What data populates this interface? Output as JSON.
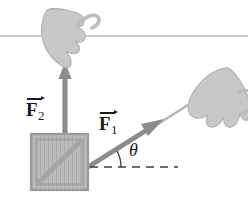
{
  "figure": {
    "background_color": "#ffffff",
    "width": 248,
    "height": 212
  },
  "labels": {
    "force_1": {
      "symbol": "F",
      "subscript": "1",
      "name": "F1"
    },
    "force_2": {
      "symbol": "F",
      "subscript": "2",
      "name": "F2"
    },
    "angle": {
      "symbol": "θ",
      "name": "theta"
    }
  },
  "colors": {
    "arrow": "#8c8c8c",
    "hand": "#c9c9c9",
    "hand_outline": "#b0b0b0",
    "crate_fill": "#bdbdbd",
    "crate_border": "#9a9a9a",
    "crate_plank": "#a8a8a8",
    "ceiling_line": "#b8b8b8",
    "dashed_line": "#3a3a3a",
    "text": "#1a1a1a"
  },
  "elements": {
    "ceiling_line": {
      "name": "ceiling-line",
      "y": 36,
      "x_start": 0,
      "x_end": 248
    },
    "crate": {
      "name": "crate",
      "x": 31,
      "y": 134,
      "width": 57,
      "height": 56
    },
    "force_2_arrow": {
      "name": "force-2-arrow",
      "from_x": 65,
      "from_y": 134,
      "to_x": 65,
      "to_y": 66,
      "direction": "up",
      "angle_degrees": 90
    },
    "force_1_arrow": {
      "name": "force-1-arrow",
      "from_x": 88,
      "from_y": 167,
      "to_x": 162,
      "to_y": 121,
      "direction": "up-right",
      "angle_degrees": 28
    },
    "dashed_reference_line": {
      "name": "dashed-reference-line",
      "y": 167,
      "x_start": 90,
      "x_end": 178
    },
    "angle_arc": {
      "name": "angle-arc",
      "center_x": 88,
      "center_y": 167,
      "radius": 30
    },
    "hand_top": {
      "name": "hand-top",
      "grips": "rope-vertical"
    },
    "hand_right": {
      "name": "hand-right",
      "grips": "rope-diagonal"
    }
  }
}
